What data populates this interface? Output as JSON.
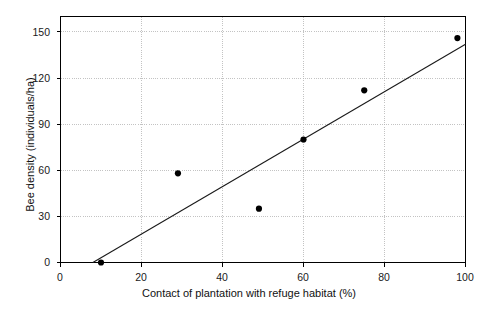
{
  "chart_data": {
    "type": "scatter",
    "title": "",
    "xlabel": "Contact of plantation with refuge habitat (%)",
    "ylabel": "Bee density (individuals/ha)",
    "xlim": [
      0,
      100
    ],
    "ylim": [
      0,
      160
    ],
    "xticks": [
      0,
      20,
      40,
      60,
      80,
      100
    ],
    "yticks": [
      0,
      30,
      60,
      90,
      120,
      150
    ],
    "grid": true,
    "legend": "none",
    "points": [
      {
        "x": 10,
        "y": 0
      },
      {
        "x": 29,
        "y": 58
      },
      {
        "x": 49,
        "y": 35
      },
      {
        "x": 60,
        "y": 80
      },
      {
        "x": 75,
        "y": 112
      },
      {
        "x": 98,
        "y": 146
      }
    ],
    "trendline": {
      "x_start": 8,
      "y_start": 0,
      "x_end": 100,
      "y_end": 142
    },
    "marker": {
      "shape": "circle",
      "color": "#000000",
      "size": 5
    },
    "line_color": "#1a1a1a",
    "grid_color": "#b4b4b4",
    "axis_color": "#000000"
  },
  "axes": {
    "x_tick_labels": [
      "0",
      "20",
      "40",
      "60",
      "80",
      "100"
    ],
    "y_tick_labels": [
      "0",
      "30",
      "60",
      "90",
      "120",
      "150"
    ],
    "x_title": "Contact of plantation with refuge habitat (%)",
    "y_title": "Bee density (individuals/ha)"
  }
}
